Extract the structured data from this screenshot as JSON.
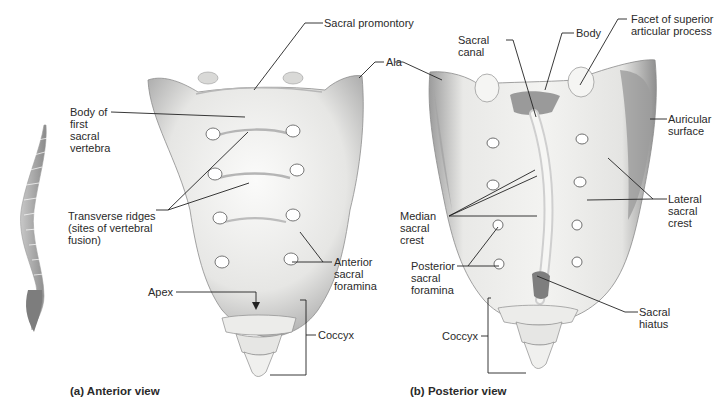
{
  "figure": {
    "panels": [
      {
        "id": "a",
        "caption": "(a) Anterior view",
        "labels": {
          "sacral_promontory": "Sacral promontory",
          "ala": "Ala",
          "body_first": "Body of\nfirst\nsacral\nvertebra",
          "transverse_ridges": "Transverse ridges\n(sites of vertebral\nfusion)",
          "anterior_foramina": "Anterior\nsacral\nforamina",
          "apex": "Apex",
          "coccyx": "Coccyx"
        }
      },
      {
        "id": "b",
        "caption": "(b) Posterior view",
        "labels": {
          "sacral_canal": "Sacral\ncanal",
          "body": "Body",
          "facet": "Facet of superior\narticular process",
          "auricular_surface": "Auricular\nsurface",
          "lateral_crest": "Lateral\nsacral\ncrest",
          "median_crest": "Median\nsacral\ncrest",
          "posterior_foramina": "Posterior\nsacral\nforamina",
          "sacral_hiatus": "Sacral\nhiatus",
          "coccyx": "Coccyx"
        }
      }
    ],
    "inset": "vertebral-column-lateral-icon",
    "colors": {
      "bone_light": "#f4f4f2",
      "bone_shade": "#bdbdbd",
      "bone_dark": "#8a8a8a",
      "leader_line": "#222222",
      "text": "#2a2a2a"
    }
  }
}
